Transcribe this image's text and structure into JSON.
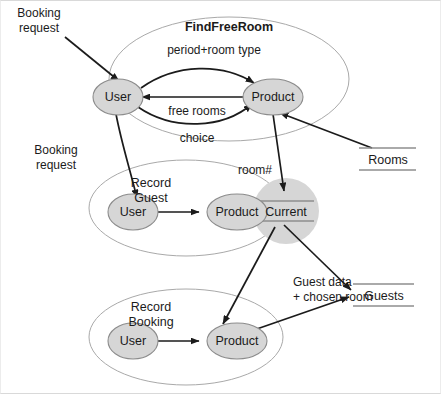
{
  "diagram": {
    "type": "data-flow-diagram",
    "colors": {
      "node_fill": "#d6d6d6",
      "node_stroke": "#8c8c8c",
      "boundary_stroke": "#a9a9a9",
      "flow_stroke": "#1b1b1b",
      "text": "#1b1b1b",
      "page_border": "#d9d9d9",
      "background": "#ffffff"
    },
    "processes": [
      {
        "id": "find-free-room",
        "title": "FindFreeRoom",
        "title_bold": true,
        "nodes": [
          {
            "id": "ffr-user",
            "label": "User"
          },
          {
            "id": "ffr-product",
            "label": "Product"
          }
        ]
      },
      {
        "id": "record-guest",
        "title_line1": "Record",
        "title_line2": "Guest",
        "title_bold": false,
        "nodes": [
          {
            "id": "rg-user",
            "label": "User"
          },
          {
            "id": "rg-product",
            "label": "Product"
          }
        ]
      },
      {
        "id": "record-booking",
        "title_line1": "Record",
        "title_line2": "Booking",
        "title_bold": false,
        "nodes": [
          {
            "id": "rb-user",
            "label": "User"
          },
          {
            "id": "rb-product",
            "label": "Product"
          }
        ]
      }
    ],
    "data_stores": [
      {
        "id": "current-store",
        "label": "Current",
        "shape": "circle"
      },
      {
        "id": "rooms-store",
        "label": "Rooms",
        "shape": "open-rect"
      },
      {
        "id": "guests-store",
        "label": "Guests",
        "shape": "open-rect"
      }
    ],
    "flows": [
      {
        "id": "booking-request-top",
        "label_line1": "Booking",
        "label_line2": "request",
        "from": "external",
        "to": "ffr-user"
      },
      {
        "id": "booking-request-middle",
        "label_line1": "Booking",
        "label_line2": "request",
        "from": "ffr-user",
        "to": "rg-user"
      },
      {
        "id": "period-room-type",
        "label": "period+room type",
        "from": "ffr-user",
        "to": "ffr-product"
      },
      {
        "id": "free-rooms",
        "label": "free rooms",
        "from": "ffr-product",
        "to": "ffr-user"
      },
      {
        "id": "choice",
        "label": "choice",
        "from": "ffr-user",
        "to": "ffr-product"
      },
      {
        "id": "rooms-in",
        "label": "",
        "from": "rooms-store",
        "to": "ffr-product"
      },
      {
        "id": "room-number",
        "label": "room#",
        "from": "ffr-product",
        "to": "current-store"
      },
      {
        "id": "rg-user-product",
        "label": "",
        "from": "rg-user",
        "to": "rg-product"
      },
      {
        "id": "rg-current",
        "label": "",
        "from": "rg-product",
        "to": "current-store"
      },
      {
        "id": "guest-data",
        "label_line1": "Guest data",
        "label_line2": "+ chosen room",
        "from": "current-store",
        "to": "guests-store"
      },
      {
        "id": "rb-user-product",
        "label": "",
        "from": "rb-user",
        "to": "rb-product"
      },
      {
        "id": "rb-guests",
        "label": "",
        "from": "rb-product",
        "to": "guests-store"
      },
      {
        "id": "current-rb",
        "label": "",
        "from": "current-store",
        "to": "rb-product"
      }
    ]
  }
}
